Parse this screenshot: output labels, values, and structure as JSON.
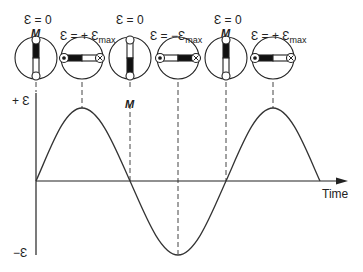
{
  "diagram": {
    "type": "ac-generator-emf-cycle",
    "axis": {
      "y_positive_label": "+ Ɛ",
      "y_negative_label": "−Ɛ",
      "x_label": "Time"
    },
    "states": [
      {
        "emf_label": "Ɛ = 0",
        "emf_sub": "",
        "magnet_label": "M",
        "magnet_pos": "top",
        "orientation": "vertical"
      },
      {
        "emf_label": "Ɛ = + Ɛ",
        "emf_sub": "max",
        "magnet_label": "",
        "orientation": "horizontal"
      },
      {
        "emf_label": "Ɛ = 0",
        "emf_sub": "",
        "magnet_label": "M",
        "magnet_pos": "bottom",
        "orientation": "vertical"
      },
      {
        "emf_label": "Ɛ = −Ɛ",
        "emf_sub": "max",
        "magnet_label": "",
        "orientation": "horizontal"
      },
      {
        "emf_label": "Ɛ = 0",
        "emf_sub": "",
        "magnet_label": "M",
        "magnet_pos": "top",
        "orientation": "vertical"
      },
      {
        "emf_label": "Ɛ = + Ɛ",
        "emf_sub": "max",
        "magnet_label": "",
        "orientation": "horizontal"
      }
    ],
    "colors": {
      "ink": "#222222",
      "background": "#ffffff"
    }
  }
}
